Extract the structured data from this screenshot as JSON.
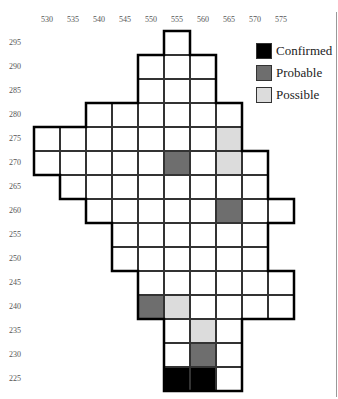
{
  "colors": {
    "confirmed": "#000000",
    "probable": "#6e6e6e",
    "possible": "#dcdcdc",
    "empty": "#ffffff"
  },
  "x_axis": [
    "530",
    "535",
    "540",
    "545",
    "550",
    "555",
    "560",
    "565",
    "570",
    "575"
  ],
  "y_axis": [
    "295",
    "290",
    "285",
    "280",
    "275",
    "270",
    "265",
    "260",
    "255",
    "250",
    "245",
    "240",
    "235",
    "230",
    "225"
  ],
  "legend": [
    {
      "label": "Confirmed",
      "status": "confirmed"
    },
    {
      "label": "Probable",
      "status": "probable"
    },
    {
      "label": "Possible",
      "status": "possible"
    }
  ],
  "rows": [
    {
      "y": "295",
      "from": "555",
      "to": "555",
      "marked": {}
    },
    {
      "y": "290",
      "from": "550",
      "to": "560",
      "marked": {}
    },
    {
      "y": "285",
      "from": "550",
      "to": "560",
      "marked": {}
    },
    {
      "y": "280",
      "from": "540",
      "to": "565",
      "marked": {}
    },
    {
      "y": "275",
      "from": "530",
      "to": "565",
      "marked": {
        "565": "possible"
      }
    },
    {
      "y": "270",
      "from": "530",
      "to": "570",
      "marked": {
        "555": "probable",
        "565": "possible"
      }
    },
    {
      "y": "265",
      "from": "535",
      "to": "570",
      "marked": {}
    },
    {
      "y": "260",
      "from": "540",
      "to": "575",
      "marked": {
        "565": "probable"
      }
    },
    {
      "y": "255",
      "from": "545",
      "to": "570",
      "marked": {}
    },
    {
      "y": "250",
      "from": "545",
      "to": "570",
      "marked": {}
    },
    {
      "y": "245",
      "from": "550",
      "to": "575",
      "marked": {}
    },
    {
      "y": "240",
      "from": "550",
      "to": "575",
      "marked": {
        "550": "probable",
        "555": "possible"
      }
    },
    {
      "y": "235",
      "from": "555",
      "to": "565",
      "marked": {
        "560": "possible"
      }
    },
    {
      "y": "230",
      "from": "555",
      "to": "565",
      "marked": {
        "560": "probable"
      }
    },
    {
      "y": "225",
      "from": "555",
      "to": "565",
      "marked": {
        "555": "confirmed",
        "560": "confirmed"
      }
    }
  ]
}
